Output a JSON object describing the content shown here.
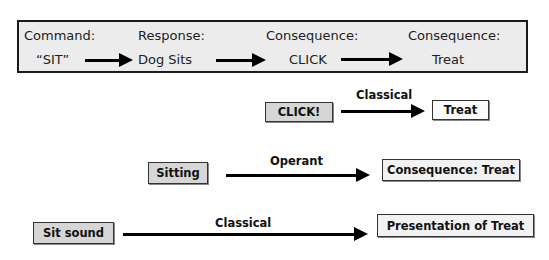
{
  "top_panel": {
    "columns": [
      {
        "header": "Command:",
        "value": "“SIT”"
      },
      {
        "header": "Response:",
        "value": "Dog Sits"
      },
      {
        "header": "Consequence:",
        "value": "CLICK"
      },
      {
        "header": "Consequence:",
        "value": "Treat"
      }
    ],
    "arrow_icon": "right-arrow-icon"
  },
  "rows": [
    {
      "source": "CLICK!",
      "arrow_label": "Classical",
      "target": "Treat"
    },
    {
      "source": "Sitting",
      "arrow_label": "Operant",
      "target": "Consequence: Treat"
    },
    {
      "source": "Sit sound",
      "arrow_label": "Classical",
      "target": "Presentation of Treat"
    }
  ],
  "colors": {
    "panel_fill": "#ececec",
    "source_box_fill": "#d6d6d6",
    "target_box_fill": "#f2f2f2",
    "arrow": "#000000"
  }
}
